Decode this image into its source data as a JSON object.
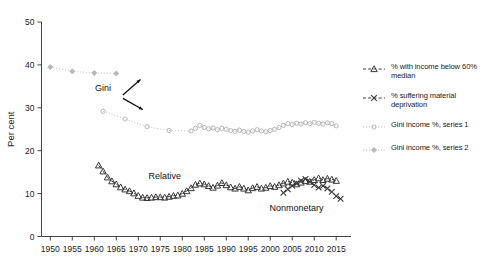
{
  "chart_data": {
    "type": "line",
    "title": "",
    "xlabel": "",
    "ylabel": "Per cent",
    "xlim": [
      1948,
      2017
    ],
    "ylim": [
      0,
      50
    ],
    "yticks": [
      0,
      10,
      20,
      30,
      40,
      50
    ],
    "xticks": [
      1950,
      1955,
      1960,
      1965,
      1970,
      1975,
      1980,
      1985,
      1990,
      1995,
      2000,
      2005,
      2010,
      2015
    ],
    "grid": false,
    "legend_position": "right",
    "annotations": [
      {
        "text": "Gini",
        "x": 1962,
        "y": 34.0
      },
      {
        "text": "Relative",
        "x": 1976,
        "y": 13.4
      },
      {
        "text": "Nonmonetary",
        "x": 2006,
        "y": 6.0
      }
    ],
    "series": [
      {
        "name": "% with income below 60% median",
        "marker": "triangle",
        "line": "dashed",
        "color": "#3a3a3a",
        "points": [
          [
            1961,
            16.6
          ],
          [
            1962,
            15.2
          ],
          [
            1963,
            13.8
          ],
          [
            1964,
            12.9
          ],
          [
            1965,
            12.2
          ],
          [
            1966,
            11.5
          ],
          [
            1967,
            11.0
          ],
          [
            1968,
            10.6
          ],
          [
            1969,
            10.1
          ],
          [
            1970,
            9.5
          ],
          [
            1971,
            9.1
          ],
          [
            1972,
            9.0
          ],
          [
            1973,
            9.1
          ],
          [
            1974,
            9.2
          ],
          [
            1975,
            9.2
          ],
          [
            1976,
            9.1
          ],
          [
            1977,
            9.3
          ],
          [
            1978,
            9.5
          ],
          [
            1979,
            9.6
          ],
          [
            1980,
            10.0
          ],
          [
            1981,
            10.6
          ],
          [
            1982,
            11.3
          ],
          [
            1983,
            12.1
          ],
          [
            1984,
            12.4
          ],
          [
            1985,
            12.2
          ],
          [
            1986,
            11.8
          ],
          [
            1987,
            11.4
          ],
          [
            1988,
            11.9
          ],
          [
            1989,
            12.5
          ],
          [
            1990,
            12.0
          ],
          [
            1991,
            11.5
          ],
          [
            1992,
            11.2
          ],
          [
            1993,
            11.6
          ],
          [
            1994,
            11.2
          ],
          [
            1995,
            10.8
          ],
          [
            1996,
            11.3
          ],
          [
            1997,
            11.6
          ],
          [
            1998,
            11.2
          ],
          [
            1999,
            11.4
          ],
          [
            2000,
            11.8
          ],
          [
            2001,
            11.6
          ],
          [
            2002,
            12.0
          ],
          [
            2003,
            12.4
          ],
          [
            2004,
            12.8
          ],
          [
            2005,
            12.6
          ],
          [
            2006,
            12.2
          ],
          [
            2007,
            12.6
          ],
          [
            2008,
            13.0
          ],
          [
            2009,
            12.8
          ],
          [
            2010,
            13.2
          ],
          [
            2011,
            13.6
          ],
          [
            2012,
            13.2
          ],
          [
            2013,
            13.5
          ],
          [
            2014,
            13.3
          ],
          [
            2015,
            13.0
          ]
        ]
      },
      {
        "name": "% suffering material deprivation",
        "marker": "x",
        "line": "dashed",
        "color": "#3a3a3a",
        "points": [
          [
            2003,
            10.2
          ],
          [
            2004,
            11.0
          ],
          [
            2005,
            11.8
          ],
          [
            2006,
            12.4
          ],
          [
            2007,
            13.0
          ],
          [
            2008,
            13.4
          ],
          [
            2009,
            12.8
          ],
          [
            2010,
            12.0
          ],
          [
            2011,
            11.4
          ],
          [
            2012,
            11.8
          ],
          [
            2013,
            11.2
          ],
          [
            2014,
            10.4
          ],
          [
            2015,
            9.4
          ],
          [
            2016,
            8.8
          ]
        ]
      },
      {
        "name": "Gini income %, series 1",
        "marker": "circle",
        "line": "dotted",
        "color": "#b8b8b8",
        "points": [
          [
            1962,
            29.2
          ],
          [
            1967,
            27.4
          ],
          [
            1972,
            25.6
          ],
          [
            1977,
            24.7
          ],
          [
            1982,
            24.6
          ],
          [
            1983,
            25.2
          ],
          [
            1984,
            25.9
          ],
          [
            1985,
            25.4
          ],
          [
            1986,
            25.1
          ],
          [
            1987,
            25.3
          ],
          [
            1988,
            24.9
          ],
          [
            1989,
            25.2
          ],
          [
            1990,
            25.0
          ],
          [
            1991,
            24.7
          ],
          [
            1992,
            24.5
          ],
          [
            1993,
            24.8
          ],
          [
            1994,
            24.5
          ],
          [
            1995,
            24.3
          ],
          [
            1996,
            24.6
          ],
          [
            1997,
            24.9
          ],
          [
            1998,
            24.6
          ],
          [
            1999,
            24.4
          ],
          [
            2000,
            24.7
          ],
          [
            2001,
            25.0
          ],
          [
            2002,
            25.4
          ],
          [
            2003,
            25.9
          ],
          [
            2004,
            26.3
          ],
          [
            2005,
            26.1
          ],
          [
            2006,
            26.4
          ],
          [
            2007,
            26.2
          ],
          [
            2008,
            26.5
          ],
          [
            2009,
            26.3
          ],
          [
            2010,
            26.6
          ],
          [
            2011,
            26.4
          ],
          [
            2012,
            26.2
          ],
          [
            2013,
            26.5
          ],
          [
            2014,
            26.3
          ],
          [
            2015,
            25.8
          ]
        ]
      },
      {
        "name": "Gini income %, series 2",
        "marker": "diamond",
        "line": "dotted",
        "color": "#b8b8b8",
        "points": [
          [
            1950,
            39.5
          ],
          [
            1955,
            38.5
          ],
          [
            1960,
            38.1
          ],
          [
            1965,
            38.0
          ]
        ]
      }
    ]
  },
  "legend": {
    "items": [
      {
        "label": "% with income below 60% median",
        "marker": "triangle-marker-icon"
      },
      {
        "label": "% suffering material deprivation",
        "marker": "x-marker-icon"
      },
      {
        "label": "Gini income %, series 1",
        "marker": "circle-marker-icon"
      },
      {
        "label": "Gini income %, series 2",
        "marker": "diamond-marker-icon"
      }
    ]
  },
  "colors": {
    "background": "#ffffff",
    "axis": "#444444",
    "dark_series": "#3a3a3a",
    "light_series": "#b8b8b8",
    "text": "#1a1a1a"
  }
}
